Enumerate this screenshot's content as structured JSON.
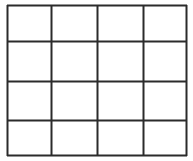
{
  "diagram": {
    "type": "grid",
    "rows": 4,
    "columns": 4,
    "line_color": "#2b2b2b",
    "background": "#ffffff",
    "bounds": {
      "left": 7,
      "top": 5,
      "right": 186,
      "bottom": 155
    },
    "column_lines_x": [
      7,
      51,
      97,
      143,
      186
    ],
    "row_lines_y": [
      5,
      41,
      81,
      120,
      155
    ]
  }
}
